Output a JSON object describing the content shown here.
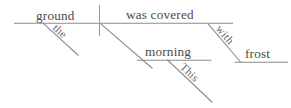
{
  "diagram": {
    "type": "reed-kellogg-sentence-diagram",
    "sentence": "This morning the ground was covered with frost.",
    "ink_color": "#8b8b8b",
    "text_color": "#4a4a4a",
    "background_color": "#ffffff",
    "words": {
      "subject": "ground",
      "predicate": "was covered",
      "subject_article": "the",
      "adverbial_noun": "morning",
      "adverbial_determiner": "This",
      "preposition": "with",
      "prep_object": "frost"
    },
    "labels": {
      "ground": "ground",
      "was_covered": "was  covered",
      "the": "the",
      "morning": "morning",
      "this": "This",
      "with": "with",
      "frost": "frost"
    }
  }
}
